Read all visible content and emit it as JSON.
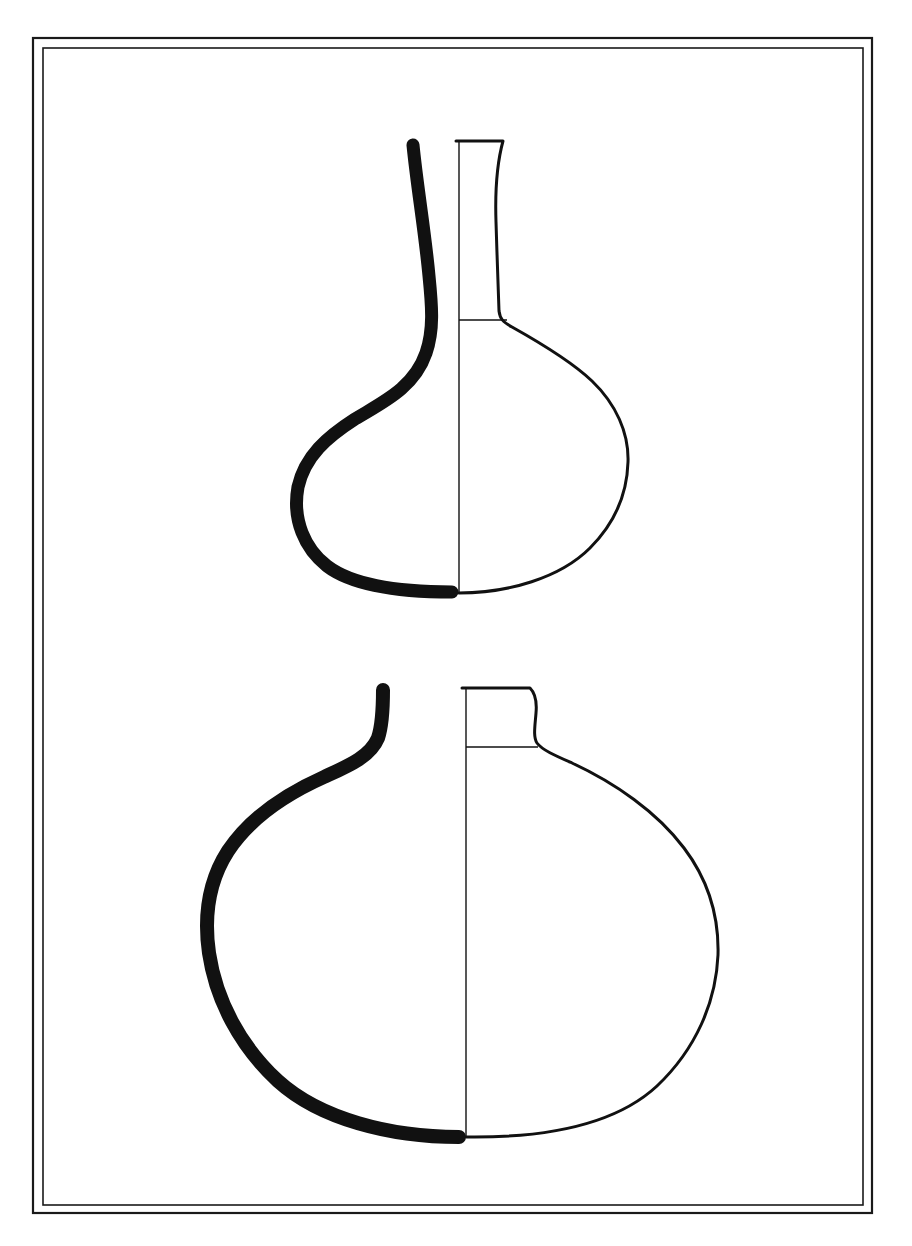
{
  "plate": {
    "title": "Ceramic vessel profile drawings",
    "description": "Archaeological line plate showing two globular flask profiles, each drawn as a half-section: thick black profile line on the left, thin exterior outline on the right, with a vertical axis line.",
    "background_color": "#ffffff",
    "ink_color": "#111111"
  },
  "frame": {
    "name": "double-rule-border",
    "outer": {
      "x": 33,
      "y": 38,
      "width": 839,
      "height": 1175,
      "stroke_width": 2.2,
      "color": "#1a1a1a"
    },
    "inner": {
      "x": 43,
      "y": 48,
      "width": 820,
      "height": 1157,
      "stroke_width": 1.6,
      "color": "#1a1a1a"
    }
  },
  "figures": [
    {
      "id": "vessel-upper",
      "label": "Upper vessel: tall-necked globular flask",
      "axis_x": 459,
      "rim_y": 141,
      "neck_base_y": 320,
      "base_y": 593,
      "max_left_x": 296,
      "max_right_x": 628,
      "section_stroke_width": 13,
      "outline_stroke_width": 3.0,
      "thin_stroke_width": 1.4,
      "section_path": "M 413 145 C 417 186 425 232 429 276 C 432 306 434 330 426 353 C 414 388 383 402 355 419 C 327 437 305 456 298 487 C 292 520 305 549 327 566 C 352 585 400 592 452 592",
      "outline_path": "M 456 141 L 503 141 C 497 163 495 192 496 222 C 497 252 498 288 499 311 C 500 319 503 322 512 327 C 537 341 570 360 592 381 C 616 404 629 433 628 462 C 627 496 613 525 590 548 C 560 578 508 593 459 593",
      "neckline_path": "M 459 320 L 507 320",
      "axis_path": "M 459 141 L 459 593"
    },
    {
      "id": "vessel-lower",
      "label": "Lower vessel: short-necked globular flask",
      "axis_x": 466,
      "rim_y": 688,
      "neck_base_y": 747,
      "base_y": 1137,
      "max_left_x": 206,
      "max_right_x": 719,
      "section_stroke_width": 14,
      "outline_stroke_width": 3.0,
      "thin_stroke_width": 1.4,
      "section_path": "M 383 690 C 383 710 382 726 378 738 C 370 757 348 766 324 777 C 286 794 250 818 228 851 C 208 882 204 918 209 953 C 216 1000 240 1046 278 1081 C 320 1119 390 1137 459 1137",
      "outline_path": "M 462 688 L 530 688 C 536 694 537 702 536 713 C 535 726 533 737 537 743 C 542 750 556 756 572 763 C 615 783 657 812 684 848 C 709 881 719 919 718 955 C 716 1002 696 1049 657 1086 C 614 1126 540 1138 466 1137",
      "neckline_path": "M 466 747 L 538 747",
      "axis_path": "M 466 688 L 466 1137"
    }
  ]
}
